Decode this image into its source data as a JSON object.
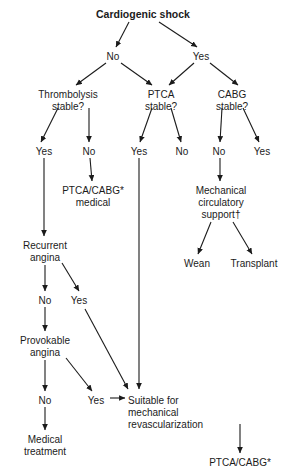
{
  "figure": {
    "type": "flowchart",
    "title": "Cardiogenic shock",
    "domain": "clinical decision algorithm",
    "footnote_markers": [
      "*",
      "†"
    ]
  },
  "nodes": {
    "root": {
      "label": "Cardiogenic shock",
      "x": 143,
      "y": 14,
      "bold": true
    },
    "root_no": {
      "label": "No",
      "x": 113,
      "y": 57
    },
    "root_yes": {
      "label": "Yes",
      "x": 201,
      "y": 57
    },
    "q_thrombolysis": {
      "line1": "Thrombolysis",
      "line2": "stable?",
      "x": 68,
      "y": 95
    },
    "q_ptca": {
      "line1": "PTCA",
      "line2": "stable?",
      "x": 161,
      "y": 95
    },
    "q_cabg": {
      "line1": "CABG",
      "line2": "stable?",
      "x": 232,
      "y": 95
    },
    "thromb_yes": {
      "label": "Yes",
      "x": 44,
      "y": 152
    },
    "thromb_no": {
      "label": "No",
      "x": 89,
      "y": 152
    },
    "ptca_yes": {
      "label": "Yes",
      "x": 139,
      "y": 152
    },
    "ptca_no": {
      "label": "No",
      "x": 182,
      "y": 152
    },
    "cabg_no": {
      "label": "No",
      "x": 219,
      "y": 152
    },
    "cabg_yes": {
      "label": "Yes",
      "x": 262,
      "y": 152
    },
    "ptca_cabg_med": {
      "line1": "PTCA/CABG*",
      "line2": "medical",
      "x": 93,
      "y": 191
    },
    "mech_support": {
      "line1": "Mechanical",
      "line2": "circulatory",
      "line3": "support†",
      "x": 221,
      "y": 191
    },
    "wean": {
      "label": "Wean",
      "x": 197,
      "y": 264
    },
    "transplant": {
      "label": "Transplant",
      "x": 254,
      "y": 264
    },
    "recurrent_angina": {
      "line1": "Recurrent",
      "line2": "angina",
      "x": 45,
      "y": 246
    },
    "rec_no": {
      "label": "No",
      "x": 45,
      "y": 301
    },
    "rec_yes": {
      "label": "Yes",
      "x": 79,
      "y": 301
    },
    "provokable_angina": {
      "line1": "Provokable",
      "line2": "angina",
      "x": 45,
      "y": 341
    },
    "prov_no": {
      "label": "No",
      "x": 45,
      "y": 401
    },
    "prov_yes": {
      "label": "Yes",
      "x": 96,
      "y": 401
    },
    "suitable": {
      "line1": "Suitable for",
      "line2": "mechanical",
      "line3": "revascularization",
      "x": 128,
      "y": 401
    },
    "medical_treatment": {
      "line1": "Medical",
      "line2": "treatment",
      "x": 45,
      "y": 440
    },
    "final_ptca_cabg": {
      "label": "PTCA/CABG*",
      "x": 240,
      "y": 463
    }
  },
  "edges": [
    {
      "from": "root",
      "to": "root_no",
      "kind": "diagonal"
    },
    {
      "from": "root",
      "to": "root_yes",
      "kind": "diagonal"
    },
    {
      "from": "root_no",
      "to": "q_thrombolysis",
      "kind": "diagonal"
    },
    {
      "from": "root_no",
      "to": "q_ptca",
      "kind": "diagonal"
    },
    {
      "from": "root_yes",
      "to": "q_ptca",
      "kind": "diagonal"
    },
    {
      "from": "root_yes",
      "to": "q_cabg",
      "kind": "diagonal"
    },
    {
      "from": "q_thrombolysis",
      "to": "thromb_yes",
      "kind": "diagonal"
    },
    {
      "from": "q_thrombolysis",
      "to": "thromb_no",
      "kind": "vertical"
    },
    {
      "from": "q_ptca",
      "to": "ptca_yes",
      "kind": "diagonal"
    },
    {
      "from": "q_ptca",
      "to": "ptca_no",
      "kind": "diagonal"
    },
    {
      "from": "q_cabg",
      "to": "cabg_no",
      "kind": "vertical"
    },
    {
      "from": "q_cabg",
      "to": "cabg_yes",
      "kind": "diagonal"
    },
    {
      "from": "thromb_no",
      "to": "ptca_cabg_med",
      "kind": "vertical"
    },
    {
      "from": "cabg_no",
      "to": "mech_support",
      "kind": "vertical"
    },
    {
      "from": "mech_support",
      "to": "wean",
      "kind": "diagonal"
    },
    {
      "from": "mech_support",
      "to": "transplant",
      "kind": "diagonal"
    },
    {
      "from": "thromb_yes",
      "to": "recurrent_angina",
      "kind": "vertical-long"
    },
    {
      "from": "recurrent_angina",
      "to": "rec_no",
      "kind": "vertical"
    },
    {
      "from": "recurrent_angina",
      "to": "rec_yes",
      "kind": "diagonal"
    },
    {
      "from": "rec_no",
      "to": "provokable_angina",
      "kind": "vertical"
    },
    {
      "from": "provokable_angina",
      "to": "prov_no",
      "kind": "vertical"
    },
    {
      "from": "provokable_angina",
      "to": "prov_yes",
      "kind": "diagonal"
    },
    {
      "from": "rec_yes",
      "to": "suitable",
      "kind": "diagonal-long"
    },
    {
      "from": "ptca_yes",
      "to": "suitable",
      "kind": "vertical-long"
    },
    {
      "from": "prov_yes",
      "to": "suitable",
      "kind": "horizontal"
    },
    {
      "from": "prov_no",
      "to": "medical_treatment",
      "kind": "vertical"
    },
    {
      "from": "suitable",
      "to": "final_ptca_cabg",
      "kind": "vertical"
    }
  ],
  "colors": {
    "ink": "#1b1b1b",
    "background": "#ffffff"
  }
}
